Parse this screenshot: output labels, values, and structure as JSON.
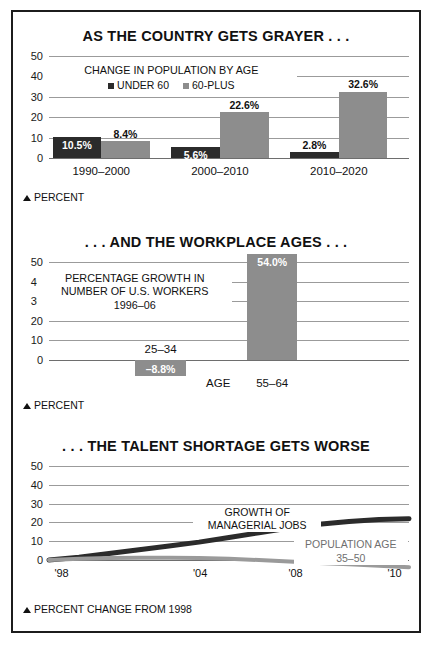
{
  "page": {
    "background": "#ffffff",
    "border_color": "#1c1c1c"
  },
  "colors": {
    "dark_series": "#2b2b2b",
    "light_series": "#8d8d8d",
    "gridline": "#9b9b9b",
    "text": "#111111"
  },
  "chart_data": [
    {
      "type": "bar",
      "id": "population-by-age",
      "title": "AS THE COUNTRY GETS GRAYER . . .",
      "caption_line1": "CHANGE IN POPULATION BY AGE",
      "xlabel": "",
      "ylabel": "PERCENT",
      "footnote": "PERCENT",
      "ylim": [
        0,
        50
      ],
      "yticks": [
        "0",
        "10",
        "20",
        "30",
        "40",
        "50"
      ],
      "grid": true,
      "legend_position": "top-center",
      "categories": [
        "1990–2000",
        "2000–2010",
        "2010–2020"
      ],
      "series": [
        {
          "name": "UNDER 60",
          "color": "#2b2b2b",
          "values": [
            10.5,
            5.6,
            2.8
          ],
          "labels": [
            "10.5%",
            "5.6%",
            "2.8%"
          ]
        },
        {
          "name": "60-PLUS",
          "color": "#8d8d8d",
          "values": [
            8.4,
            22.6,
            32.6
          ],
          "labels": [
            "8.4%",
            "22.6%",
            "32.6%"
          ]
        }
      ]
    },
    {
      "type": "bar",
      "id": "workplace-ages",
      "title": ". . . AND THE WORKPLACE AGES . . .",
      "caption_line1": "PERCENTAGE GROWTH IN",
      "caption_line2": "NUMBER OF U.S. WORKERS",
      "caption_line3": "1996–06",
      "xlabel": "AGE",
      "ylabel": "PERCENT",
      "footnote": "PERCENT",
      "ylim": [
        -10,
        50
      ],
      "yticks": [
        "0",
        "10",
        "20",
        "30",
        "40",
        "50"
      ],
      "grid": true,
      "categories": [
        "25–34",
        "55–64"
      ],
      "values": [
        -8.8,
        54.0
      ],
      "labels": [
        "–8.8%",
        "54.0%"
      ],
      "bar_color": "#8d8d8d"
    },
    {
      "type": "line",
      "id": "talent-shortage",
      "title": ". . . THE TALENT SHORTAGE GETS WORSE",
      "xlabel": "",
      "ylabel": "PERCENT CHANGE FROM 1998",
      "footnote": "PERCENT CHANGE FROM 1998",
      "ylim": [
        0,
        50
      ],
      "yticks": [
        "0",
        "10",
        "20",
        "30",
        "40",
        "50"
      ],
      "xticks": [
        "'98",
        "'04",
        "'08",
        "'10"
      ],
      "xtick_years": [
        1998,
        2004,
        2008,
        2010
      ],
      "xlim": [
        1998,
        2010
      ],
      "grid": true,
      "series": [
        {
          "name": "GROWTH OF MANAGERIAL JOBS",
          "label_line1": "GROWTH OF",
          "label_line2": "MANAGERIAL JOBS",
          "color": "#2b2b2b",
          "x": [
            1998,
            1999,
            2000,
            2001,
            2002,
            2003,
            2004,
            2005,
            2006,
            2007,
            2008,
            2009,
            2010
          ],
          "values": [
            0,
            1.5,
            3.5,
            5.5,
            7.5,
            9.5,
            12,
            14.5,
            17,
            19,
            20.5,
            21.5,
            22
          ]
        },
        {
          "name": "POPULATION AGE 35-50",
          "label_line1": "POPULATION AGE",
          "label_line2": "35–50",
          "color": "#9a9a9a",
          "x": [
            1998,
            1999,
            2000,
            2001,
            2002,
            2003,
            2004,
            2005,
            2006,
            2007,
            2008,
            2009,
            2010
          ],
          "values": [
            0,
            0.6,
            1.0,
            1.2,
            1.2,
            1.0,
            0.6,
            0.0,
            -0.8,
            -1.6,
            -2.3,
            -3.0,
            -3.8
          ]
        }
      ]
    }
  ],
  "charts": {
    "chart1": {
      "title": "AS THE COUNTRY GETS GRAYER . . .",
      "caption": "CHANGE IN POPULATION BY AGE",
      "legend": [
        {
          "label": "UNDER 60"
        },
        {
          "label": "60-PLUS"
        }
      ],
      "yticks": [
        "50",
        "40",
        "30",
        "20",
        "10",
        "0"
      ],
      "groups": [
        {
          "label": "1990–2000",
          "dark_value": "10.5%",
          "light_value": "8.4%"
        },
        {
          "label": "2000–2010",
          "dark_value": "5.6%",
          "light_value": "22.6%"
        },
        {
          "label": "2010–2020",
          "dark_value": "2.8%",
          "light_value": "32.6%"
        }
      ],
      "footnote": "PERCENT"
    },
    "chart2": {
      "title": ". . . AND THE WORKPLACE AGES . . .",
      "caption_line1": "PERCENTAGE GROWTH IN",
      "caption_line2": "NUMBER OF U.S. WORKERS",
      "caption_line3": "1996–06",
      "yticks": [
        "50",
        "40",
        "30",
        "20",
        "10",
        "0"
      ],
      "axis_label": "AGE",
      "bars": [
        {
          "label": "25–34",
          "value": "–8.8%"
        },
        {
          "label": "55–64",
          "value": "54.0%"
        }
      ],
      "footnote": "PERCENT"
    },
    "chart3": {
      "title": ". . . THE TALENT SHORTAGE GETS WORSE",
      "yticks": [
        "50",
        "40",
        "30",
        "20",
        "10",
        "0"
      ],
      "xticks": [
        "'98",
        "'04",
        "'08",
        "'10"
      ],
      "series_labels": {
        "managerial_line1": "GROWTH OF",
        "managerial_line2": "MANAGERIAL JOBS",
        "population_line1": "POPULATION AGE",
        "population_line2": "35–50"
      },
      "footnote": "PERCENT CHANGE FROM 1998"
    }
  }
}
